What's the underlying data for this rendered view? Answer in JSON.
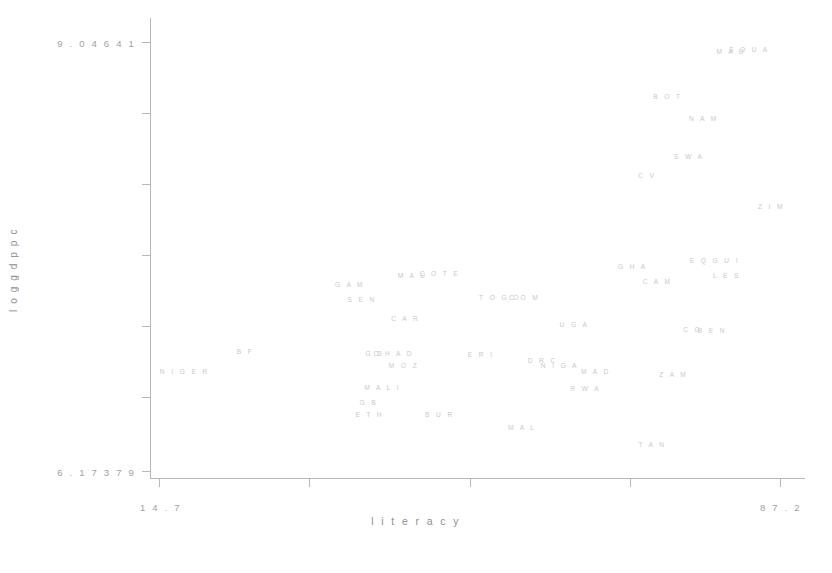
{
  "chart_data": {
    "type": "scatter",
    "title": "",
    "xlabel": "literacy",
    "ylabel": "loggdppc",
    "xlim": [
      14.7,
      87.2
    ],
    "ylim": [
      6.17379,
      9.04641
    ],
    "x_ticks": [
      "14.7",
      "87.2"
    ],
    "y_ticks": [
      "6.17379",
      "9.04641"
    ],
    "grid": false,
    "legend": "none",
    "point_style": "text-labels",
    "points": [
      {
        "label": "MAU",
        "x": 81.5,
        "y": 8.98
      },
      {
        "label": "SOUA",
        "x": 83.6,
        "y": 8.99
      },
      {
        "label": "BOT",
        "x": 74.1,
        "y": 8.68
      },
      {
        "label": "NAM",
        "x": 78.3,
        "y": 8.53
      },
      {
        "label": "SWA",
        "x": 76.6,
        "y": 8.28
      },
      {
        "label": "CV",
        "x": 71.7,
        "y": 8.15
      },
      {
        "label": "ZIM",
        "x": 86.2,
        "y": 7.94
      },
      {
        "label": "EQGUI",
        "x": 79.6,
        "y": 7.58
      },
      {
        "label": "LES",
        "x": 81.0,
        "y": 7.48
      },
      {
        "label": "GHA",
        "x": 70.0,
        "y": 7.54
      },
      {
        "label": "CAM",
        "x": 72.9,
        "y": 7.44
      },
      {
        "label": "MAU2",
        "x": 44.3,
        "y": 7.48
      },
      {
        "label": "COTE",
        "x": 47.5,
        "y": 7.49
      },
      {
        "label": "GAM",
        "x": 37.0,
        "y": 7.42
      },
      {
        "label": "SEN",
        "x": 38.4,
        "y": 7.32
      },
      {
        "label": "TOGO",
        "x": 54.5,
        "y": 7.33
      },
      {
        "label": "COM",
        "x": 57.4,
        "y": 7.33
      },
      {
        "label": "CAR",
        "x": 43.5,
        "y": 7.19
      },
      {
        "label": "UGA",
        "x": 63.2,
        "y": 7.15
      },
      {
        "label": "CG",
        "x": 77.0,
        "y": 7.12
      },
      {
        "label": "BEN",
        "x": 79.3,
        "y": 7.11
      },
      {
        "label": "BF",
        "x": 24.8,
        "y": 6.97
      },
      {
        "label": "GB",
        "x": 39.9,
        "y": 6.96
      },
      {
        "label": "CHAD",
        "x": 42.1,
        "y": 6.96
      },
      {
        "label": "MOZ",
        "x": 43.3,
        "y": 6.88
      },
      {
        "label": "ERI",
        "x": 52.3,
        "y": 6.95
      },
      {
        "label": "DRC",
        "x": 59.5,
        "y": 6.91
      },
      {
        "label": "NIGA",
        "x": 61.5,
        "y": 6.88
      },
      {
        "label": "MAD",
        "x": 65.7,
        "y": 6.84
      },
      {
        "label": "NIGER",
        "x": 17.7,
        "y": 6.84
      },
      {
        "label": "ZAM",
        "x": 74.8,
        "y": 6.82
      },
      {
        "label": "MALI",
        "x": 40.8,
        "y": 6.73
      },
      {
        "label": "RWA",
        "x": 64.5,
        "y": 6.72
      },
      {
        "label": "GB2",
        "x": 39.2,
        "y": 6.63
      },
      {
        "label": "ETH",
        "x": 39.3,
        "y": 6.55
      },
      {
        "label": "BUR",
        "x": 47.5,
        "y": 6.55
      },
      {
        "label": "MAL",
        "x": 57.1,
        "y": 6.46
      },
      {
        "label": "TAN",
        "x": 72.3,
        "y": 6.35
      }
    ],
    "point_labels_text": {
      "MAU": "M A U",
      "SOUA": "S O U A",
      "BOT": "B O T",
      "NAM": "N A M",
      "SWA": "S W A",
      "CV": "C V",
      "ZIM": "Z I M",
      "EQGUI": "E Q G U I",
      "LES": "L E S",
      "GHA": "G H A",
      "CAM": "C A M",
      "MAU2": "M A U",
      "COTE": "C O T E",
      "GAM": "G A M",
      "SEN": "S E N",
      "TOGO": "T O G O",
      "COM": "C O M",
      "CAR": "C A R",
      "UGA": "U G A",
      "CG": "C G",
      "BEN": "B E N",
      "BF": "B F",
      "GB": "G B",
      "CHAD": "C H A D",
      "MOZ": "M O Z",
      "ERI": "E R I",
      "DRC": "D R C",
      "NIGA": "N I G A",
      "MAD": "M A D",
      "NIGER": "N I G E R",
      "ZAM": "Z A M",
      "MALI": "M A L I",
      "RWA": "R W A",
      "GB2": "G B",
      "ETH": "E T H",
      "BUR": "B U R",
      "MAL": "M A L",
      "TAN": "T A N"
    }
  },
  "axes": {
    "y_title": "l o g g d p p c",
    "x_title": "l i t e r a c y",
    "y_max_label": "9 . 0 4 6 4 1",
    "y_min_label": "6 . 1 7 3 7 9",
    "x_min_label": "1 4 . 7",
    "x_max_label": "8 7 . 2"
  },
  "colors": {
    "background": "#ffffff",
    "axis": "#b8b8b8",
    "tick_text": "#a0a0a0",
    "axis_title": "#8f8f8f",
    "point_label": "#c9c9c9"
  }
}
